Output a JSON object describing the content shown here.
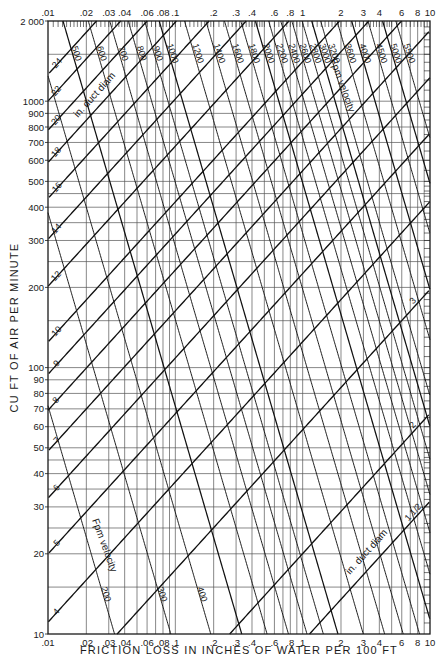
{
  "chart_data": {
    "type": "line",
    "title": "",
    "xlabel": "FRICTION LOSS IN INCHES OF WATER PER 100 FT",
    "ylabel": "CU FT OF AIR PER MINUTE",
    "xscale": "log",
    "yscale": "log",
    "xlim": [
      0.01,
      10
    ],
    "ylim": [
      10,
      2000
    ],
    "grid": true,
    "x_ticks_bottom": [
      ".01",
      ".02",
      ".03",
      ".04",
      ".06",
      ".08",
      ".1",
      ".2",
      ".3",
      ".4",
      ".6",
      ".8",
      "1",
      "2",
      "3",
      "4",
      "6",
      "8",
      "10"
    ],
    "x_ticks_top": [
      ".01",
      ".02",
      ".03",
      ".04",
      ".06",
      ".08",
      ".1",
      ".2",
      ".3",
      ".4",
      ".6",
      ".8",
      "1",
      "2",
      "3",
      "4",
      "6",
      "8",
      "10"
    ],
    "x_tick_values": [
      0.01,
      0.02,
      0.03,
      0.04,
      0.06,
      0.08,
      0.1,
      0.2,
      0.3,
      0.4,
      0.6,
      0.8,
      1,
      2,
      3,
      4,
      6,
      8,
      10
    ],
    "y_ticks": [
      "10",
      "20",
      "30",
      "40",
      "50",
      "60",
      "70",
      "80",
      "90",
      "100",
      "200",
      "300",
      "400",
      "500",
      "600",
      "700",
      "800",
      "900",
      "1000",
      "2 000"
    ],
    "y_tick_values": [
      10,
      20,
      30,
      40,
      50,
      60,
      70,
      80,
      90,
      100,
      200,
      300,
      400,
      500,
      600,
      700,
      800,
      900,
      1000,
      2000
    ],
    "families": [
      {
        "name": "in. duct diam",
        "unit": "in",
        "labels": [
          "1 1/2",
          "2",
          "3",
          "4",
          "5",
          "6",
          "7",
          "8",
          "9",
          "10",
          "12",
          "14",
          "16",
          "18",
          "20",
          "22",
          "24"
        ],
        "values": [
          1.5,
          2,
          3,
          4,
          5,
          6,
          7,
          8,
          9,
          10,
          12,
          14,
          16,
          18,
          20,
          22,
          24
        ]
      },
      {
        "name": "Fpm velocity",
        "unit": "fpm",
        "labels": [
          "200",
          "300",
          "400",
          "500",
          "600",
          "700",
          "800",
          "900",
          "1000",
          "1200",
          "1400",
          "1600",
          "1800",
          "2000",
          "2200",
          "2400",
          "2600",
          "2800",
          "3000",
          "3200",
          "3600",
          "4000",
          "4500",
          "5000",
          "5500"
        ],
        "values": [
          200,
          300,
          400,
          500,
          600,
          700,
          800,
          900,
          1000,
          1200,
          1400,
          1600,
          1800,
          2000,
          2200,
          2400,
          2600,
          2800,
          3000,
          3200,
          3600,
          4000,
          4500,
          5000,
          5500
        ]
      }
    ],
    "annotations": [
      "in. duct diam",
      "Fpm velocity",
      "in. duct diam",
      "Fpm velocity"
    ]
  }
}
